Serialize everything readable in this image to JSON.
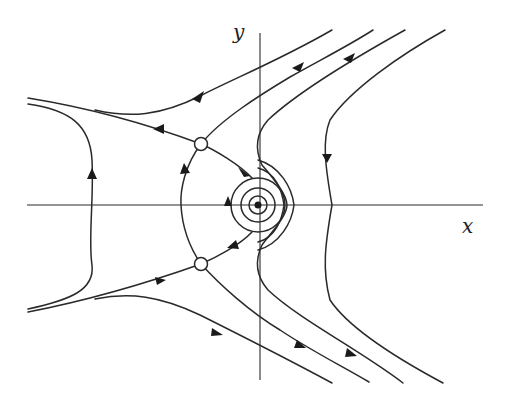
{
  "figure": {
    "type": "phase-portrait",
    "axes": {
      "x_label": "x",
      "y_label": "y"
    },
    "equilibria": [
      {
        "kind": "saddle",
        "marker": "open-circle",
        "position": "upper-left"
      },
      {
        "kind": "saddle",
        "marker": "open-circle",
        "position": "lower-left"
      },
      {
        "kind": "center",
        "marker": "filled-dot",
        "position": "origin"
      }
    ],
    "colors": {
      "line": "#2a2a2a",
      "background": "#ffffff"
    }
  }
}
